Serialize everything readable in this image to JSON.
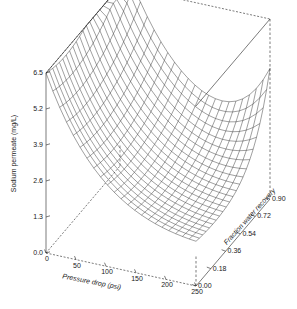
{
  "chart_data": {
    "type": "surface",
    "title": "",
    "zlabel": "Sodium permeate (mg/L)",
    "xlabel": "Pressure drop (psi)",
    "ylabel": "Fraction water recovery",
    "grid": false,
    "legend": "none",
    "projection": "3d-wireframe",
    "xlim": [
      0,
      250
    ],
    "ylim": [
      0.0,
      0.9
    ],
    "zlim": [
      0.0,
      6.5
    ],
    "x_ticks": [
      "0",
      "50",
      "100",
      "150",
      "200",
      "250"
    ],
    "x_tick_values": [
      0,
      50,
      100,
      150,
      200,
      250
    ],
    "y_ticks": [
      "0.00",
      "0.18",
      "0.36",
      "0.54",
      "0.72",
      "0.90"
    ],
    "y_tick_values": [
      0.0,
      0.18,
      0.36,
      0.54,
      0.72,
      0.9
    ],
    "z_ticks": [
      "0.0",
      "1.3",
      "2.6",
      "3.9",
      "5.2",
      "6.5"
    ],
    "z_tick_values": [
      0.0,
      1.3,
      2.6,
      3.9,
      5.2,
      6.5
    ],
    "mesh_nx": 22,
    "mesh_ny": 22,
    "surface_note": "Saddle/valley shaped response surface: sodium permeate is high at low pressure drop and high at high fraction water recovery, with a minimum in the mid-to-high pressure drop, low recovery region.",
    "surface_corners": {
      "x0_y0": 6.5,
      "x250_y0": 1.15,
      "x0_y090": 5.0,
      "x250_y090": 4.35
    },
    "z_samples": [
      {
        "x": 0,
        "y": 0.0,
        "z": 6.5
      },
      {
        "x": 0,
        "y": 0.18,
        "z": 5.95
      },
      {
        "x": 0,
        "y": 0.36,
        "z": 5.55
      },
      {
        "x": 0,
        "y": 0.54,
        "z": 5.25
      },
      {
        "x": 0,
        "y": 0.72,
        "z": 5.05
      },
      {
        "x": 0,
        "y": 0.9,
        "z": 5.0
      },
      {
        "x": 50,
        "y": 0.0,
        "z": 4.45
      },
      {
        "x": 50,
        "y": 0.18,
        "z": 3.95
      },
      {
        "x": 50,
        "y": 0.36,
        "z": 3.6
      },
      {
        "x": 50,
        "y": 0.54,
        "z": 3.4
      },
      {
        "x": 50,
        "y": 0.72,
        "z": 3.3
      },
      {
        "x": 50,
        "y": 0.9,
        "z": 3.35
      },
      {
        "x": 100,
        "y": 0.0,
        "z": 2.95
      },
      {
        "x": 100,
        "y": 0.18,
        "z": 2.5
      },
      {
        "x": 100,
        "y": 0.36,
        "z": 2.2
      },
      {
        "x": 100,
        "y": 0.54,
        "z": 2.05
      },
      {
        "x": 100,
        "y": 0.72,
        "z": 2.05
      },
      {
        "x": 100,
        "y": 0.9,
        "z": 2.2
      },
      {
        "x": 150,
        "y": 0.0,
        "z": 1.95
      },
      {
        "x": 150,
        "y": 0.18,
        "z": 1.6
      },
      {
        "x": 150,
        "y": 0.36,
        "z": 1.4
      },
      {
        "x": 150,
        "y": 0.54,
        "z": 1.35
      },
      {
        "x": 150,
        "y": 0.72,
        "z": 1.45
      },
      {
        "x": 150,
        "y": 0.9,
        "z": 1.75
      },
      {
        "x": 200,
        "y": 0.0,
        "z": 1.4
      },
      {
        "x": 200,
        "y": 0.18,
        "z": 1.15
      },
      {
        "x": 200,
        "y": 0.36,
        "z": 1.05
      },
      {
        "x": 200,
        "y": 0.54,
        "z": 1.1
      },
      {
        "x": 200,
        "y": 0.72,
        "z": 1.35
      },
      {
        "x": 200,
        "y": 0.9,
        "z": 1.8
      },
      {
        "x": 250,
        "y": 0.0,
        "z": 1.15
      },
      {
        "x": 250,
        "y": 0.18,
        "z": 1.05
      },
      {
        "x": 250,
        "y": 0.36,
        "z": 1.1
      },
      {
        "x": 250,
        "y": 0.54,
        "z": 1.35
      },
      {
        "x": 250,
        "y": 0.72,
        "z": 1.75
      },
      {
        "x": 250,
        "y": 0.9,
        "z": 4.35
      }
    ]
  }
}
